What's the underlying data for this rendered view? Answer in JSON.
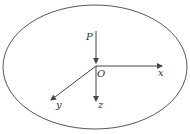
{
  "diagram": {
    "type": "coordinate-system",
    "labels": {
      "point": "P",
      "origin": "O",
      "x_axis": "x",
      "y_axis": "y",
      "z_axis": "z"
    },
    "colors": {
      "stroke": "#555555",
      "text": "#333333"
    }
  }
}
